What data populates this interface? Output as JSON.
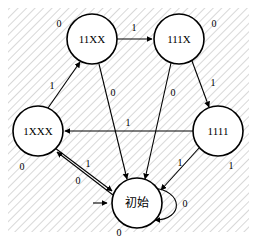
{
  "figure": {
    "type": "state-transition-diagram",
    "width": 257,
    "height": 240,
    "background_color": "#ffffff",
    "hatch_color": "#b9b9b9",
    "stroke_color": "#000000"
  },
  "nodes": [
    {
      "id": "11XX",
      "label": "11XX",
      "cx": 92,
      "cy": 39,
      "r": 25,
      "script": "latin"
    },
    {
      "id": "111X",
      "label": "111X",
      "cx": 179,
      "cy": 39,
      "r": 25,
      "script": "latin"
    },
    {
      "id": "1XXX",
      "label": "1XXX",
      "cx": 38,
      "cy": 131,
      "r": 25,
      "script": "latin"
    },
    {
      "id": "1111",
      "label": "1111",
      "cx": 218,
      "cy": 131,
      "r": 25,
      "script": "latin"
    },
    {
      "id": "start",
      "label": "初始",
      "cx": 137,
      "cy": 203,
      "r": 25,
      "script": "cjk"
    }
  ],
  "edges": [
    {
      "id": "e1",
      "from": "11XX",
      "to": "111X",
      "label": "1",
      "label_x": 134,
      "label_y": 27
    },
    {
      "id": "e2",
      "from": "1XXX",
      "to": "11XX",
      "label": "1",
      "label_x": 52,
      "label_y": 85
    },
    {
      "id": "e3",
      "from": "111X",
      "to": "1111",
      "label": "1",
      "label_x": 213,
      "label_y": 82
    },
    {
      "id": "e4",
      "from": "1111",
      "to": "1XXX",
      "label": "1",
      "label_x": 128,
      "label_y": 122
    },
    {
      "id": "e5",
      "from": "1111",
      "to": "start",
      "label": "1",
      "label_x": 180,
      "label_y": 162
    },
    {
      "id": "e6",
      "from": "start",
      "to": "1XXX",
      "label": "1",
      "label_x": 88,
      "label_y": 163
    },
    {
      "id": "e7",
      "from": "11XX",
      "to": "start",
      "label": "0",
      "label_x": 113,
      "label_y": 92
    },
    {
      "id": "e8",
      "from": "111X",
      "to": "start",
      "label": "0",
      "label_x": 173,
      "label_y": 92
    },
    {
      "id": "e9",
      "from": "1XXX",
      "to": "start",
      "label": "0",
      "label_x": 78,
      "label_y": 180
    },
    {
      "id": "e10",
      "from": "start",
      "to": "start",
      "label": "0",
      "label_x": 185,
      "label_y": 203
    }
  ],
  "standalone_labels": [
    {
      "id": "L1",
      "text": "0",
      "x": 59,
      "y": 23,
      "near": "11XX"
    },
    {
      "id": "L2",
      "text": "0",
      "x": 214,
      "y": 23,
      "near": "111X"
    },
    {
      "id": "L3",
      "text": "0",
      "x": 22,
      "y": 166,
      "near": "1XXX"
    },
    {
      "id": "L4",
      "text": "1",
      "x": 231,
      "y": 165,
      "near": "1111"
    },
    {
      "id": "L5",
      "text": "0",
      "x": 119,
      "y": 232,
      "near": "start"
    }
  ],
  "start_marker": {
    "id": "start-arrow",
    "target": "start",
    "x1": 93,
    "y1": 203,
    "x2": 110,
    "y2": 203
  }
}
